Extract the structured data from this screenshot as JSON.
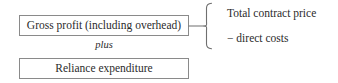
{
  "diagram": {
    "boxes": [
      {
        "id": "gross-profit",
        "label": "Gross profit (including overhead)"
      },
      {
        "id": "reliance",
        "label": "Reliance expenditure"
      }
    ],
    "operator": {
      "label": "plus"
    },
    "brace": {
      "orientation": "right-facing",
      "icon": "curly-brace-icon",
      "entries": [
        {
          "label": "Total contract price"
        },
        {
          "label": "− direct costs"
        }
      ]
    },
    "connector": {
      "icon": "horizontal-connector-line"
    },
    "colors": {
      "background": "#ffffff",
      "border": "#8a8a8a",
      "text": "#2b2b2b",
      "line": "#6f6f6f"
    }
  }
}
